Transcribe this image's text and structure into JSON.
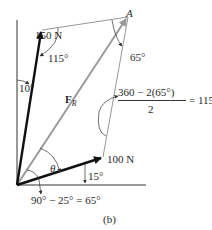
{
  "figure": {
    "caption": "(b)",
    "points": {
      "A": "A"
    },
    "forces": {
      "f1": {
        "label": "150 N",
        "angle_from_vertical": "10°"
      },
      "f2": {
        "label": "100 N",
        "angle_from_horizontal": "15°"
      },
      "resultant": {
        "symbol": "F",
        "subscript": "R"
      }
    },
    "angles": {
      "at_150N_tip": "115°",
      "at_A": "65°",
      "theta": "θ",
      "at_origin_eq": "90° − 25° = 65°"
    },
    "fraction": {
      "numerator": "360 − 2(65°)",
      "denominator": "2",
      "result": "= 115°"
    },
    "colors": {
      "force_arrow": "#111111",
      "resultant_arrow": "#9a9a9a",
      "construction_line": "#8a8a8a",
      "axis": "#333333"
    }
  }
}
